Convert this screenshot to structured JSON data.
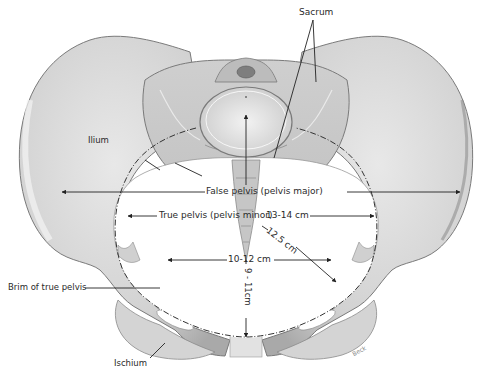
{
  "figure": {
    "labels": {
      "sacrum": "Sacrum",
      "ilium": "Ilium",
      "false_pelvis": "False pelvis (pelvis major)",
      "true_pelvis": "True pelvis (pelvis minor)",
      "transverse_diameter": "13-14 cm",
      "oblique_diameter": "12.5 cm",
      "interspinous_diameter": "10-12 cm",
      "ap_diameter": "9 - 11cm",
      "brim": "Brim of true pelvis",
      "ischium": "Ischium",
      "signature": "Beck"
    },
    "colors": {
      "bone_fill": "#d9d9d9",
      "bone_shadow": "#a8a8a8",
      "outline": "#6b6b6b",
      "line": "#222222",
      "background": "#ffffff"
    }
  }
}
